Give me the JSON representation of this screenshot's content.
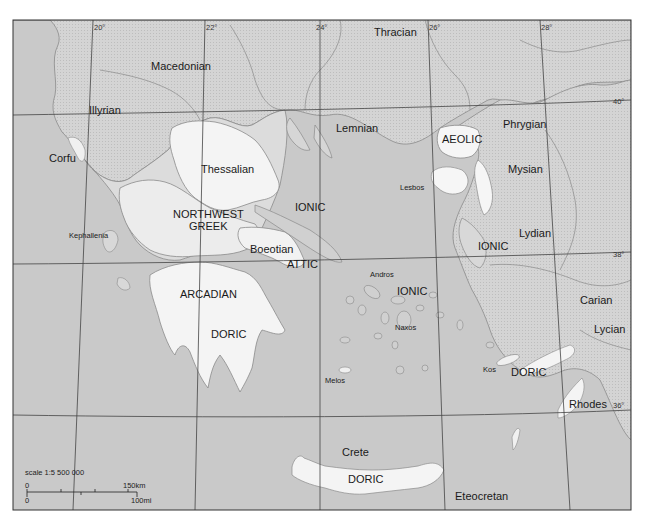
{
  "map": {
    "colors": {
      "sea": "#c9c9c9",
      "non_greek_land": "#d6d6d6",
      "greek_mainland": "#ececec",
      "greek_dialect_light": "#f6f6f6",
      "border": "#8a8a8a",
      "grid": "#444444",
      "frame": "#333333",
      "page_bg": "#ffffff"
    },
    "longitude_labels": [
      "20°",
      "22°",
      "24°",
      "26°",
      "28°"
    ],
    "latitude_labels": [
      "40°",
      "38°",
      "36°"
    ],
    "labels": {
      "thracian": "Thracian",
      "macedonian": "Macedonian",
      "illyrian": "Illyrian",
      "lemnian": "Lemnian",
      "aeolic": "AEOLIC",
      "phrygian": "Phrygian",
      "corfu": "Corfu",
      "thessalian": "Thessalian",
      "mysian": "Mysian",
      "lesbos": "Lesbos",
      "northwest": "NORTHWEST",
      "greek": "GREEK",
      "ionic_north": "IONIC",
      "kephallenia": "Kephallenia",
      "boeotian": "Boeotian",
      "ionic_east": "IONIC",
      "lydian": "Lydian",
      "attic": "ATTIC",
      "andros": "Andros",
      "ionic_cyclades": "IONIC",
      "arcadian": "ARCADIAN",
      "carian": "Carian",
      "naxos": "Naxos",
      "lycian": "Lycian",
      "doric_peloponnese": "DORIC",
      "kos": "Kos",
      "doric_dodecanese": "DORIC",
      "melos": "Melos",
      "rhodes": "Rhodes",
      "crete": "Crete",
      "doric_crete": "DORIC",
      "eteocretan": "Eteocretan"
    },
    "scale": {
      "title": "scale 1:5 500 000",
      "km_zero": "0",
      "km_end": "150km",
      "mi_zero": "0",
      "mi_end": "100mi"
    }
  }
}
